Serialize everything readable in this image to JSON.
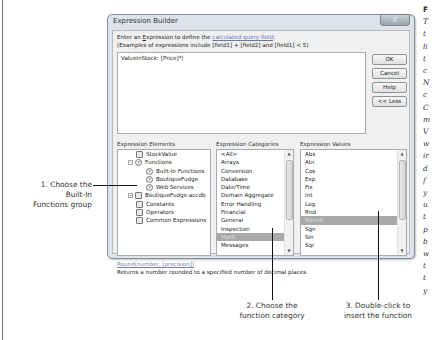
{
  "dialog": {
    "title": "Expression Builder",
    "close_label": "X",
    "prompt": {
      "prefix": "Enter an ",
      "accel_word": "E",
      "accel_rest": "xpression to define the ",
      "link": "calculated query field",
      "suffix": ":"
    },
    "examples": "(Examples of expressions include [field1] + [field2] and [field1] < 5)",
    "expression_value": "ValueInStock: [Price]*|",
    "buttons": {
      "ok": "OK",
      "cancel": "Cancel",
      "help": "Help",
      "less": "<< Less"
    },
    "elements": {
      "label": "Expression Elements",
      "items": [
        {
          "label": "StockValue",
          "icon": "query-icon",
          "indent": 0,
          "expander": ""
        },
        {
          "label": "Functions",
          "icon": "function-icon",
          "indent": 0,
          "expander": "−"
        },
        {
          "label": "Built-In Functions",
          "icon": "function-icon",
          "indent": 1,
          "expander": ""
        },
        {
          "label": "BoutiqueFudge",
          "icon": "function-icon",
          "indent": 1,
          "expander": ""
        },
        {
          "label": "Web Services",
          "icon": "function-icon",
          "indent": 1,
          "expander": ""
        },
        {
          "label": "BoutiqueFudge.accdb",
          "icon": "database-icon",
          "indent": 0,
          "expander": "+"
        },
        {
          "label": "Constants",
          "icon": "constants-icon",
          "indent": 0,
          "expander": ""
        },
        {
          "label": "Operators",
          "icon": "operators-icon",
          "indent": 0,
          "expander": ""
        },
        {
          "label": "Common Expressions",
          "icon": "common-expressions-icon",
          "indent": 0,
          "expander": ""
        }
      ]
    },
    "categories": {
      "label": "Expression Categories",
      "items": [
        "<All>",
        "Arrays",
        "Conversion",
        "Database",
        "Date/Time",
        "Domain Aggregate",
        "Error Handling",
        "Financial",
        "General",
        "Inspection",
        "Math",
        "Messages"
      ],
      "selected": "Math"
    },
    "values": {
      "label": "Expression Values",
      "items": [
        "Abs",
        "Atn",
        "Cos",
        "Exp",
        "Fix",
        "Int",
        "Log",
        "Rnd",
        "Round",
        "Sgn",
        "Sin",
        "Sqr"
      ],
      "selected": "Round"
    },
    "syntax": "Round(number, [precision])",
    "description": "Returns a number rounded to a specified number of decimal places."
  },
  "callouts": {
    "step1": [
      "1. Choose the",
      "Built-In",
      "Functions group"
    ],
    "step2": [
      "2. Choose the",
      "function category"
    ],
    "step3": [
      "3. Double-click to",
      "insert the function"
    ]
  },
  "sidebar": {
    "heading": "F",
    "lines": [
      "T",
      "t",
      "li",
      "t",
      "c",
      "N",
      "c",
      "C",
      "m",
      "V",
      "w",
      "ir",
      "d",
      "f",
      "y",
      "u",
      "t",
      "p",
      "b",
      "w",
      "t",
      "t",
      "y"
    ]
  }
}
